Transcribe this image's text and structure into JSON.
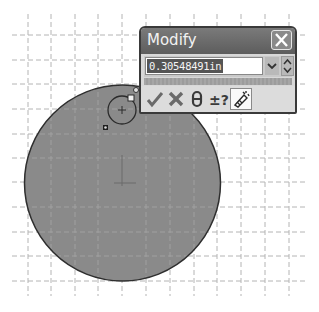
{
  "canvas": {
    "background": "#ffffff",
    "grid": {
      "color": "#b4b4b4",
      "x_lines": [
        28,
        51,
        75,
        98,
        122,
        146,
        170,
        194,
        217,
        241,
        265,
        289
      ],
      "y_lines": [
        35,
        60,
        84,
        109,
        134,
        158,
        182,
        207,
        232,
        256,
        281
      ]
    },
    "sketch_circle": {
      "cx": 122.5,
      "cy": 183,
      "r": 98,
      "fill": "#8a8a8a",
      "stroke": "#2e2e2e"
    },
    "small_circle": {
      "cx": 122,
      "cy": 110,
      "r": 14
    },
    "origin_marker": {
      "x": 122,
      "y": 183
    }
  },
  "dialog": {
    "title": "Modify",
    "value": "0.30548491in",
    "buttons": {
      "ok": "check-icon",
      "cancel": "x-icon",
      "rebuild": "rebuild-icon",
      "reverse": "reverse-sense-icon",
      "mark": "mark-dimension-icon"
    },
    "reverse_label": "±?"
  }
}
